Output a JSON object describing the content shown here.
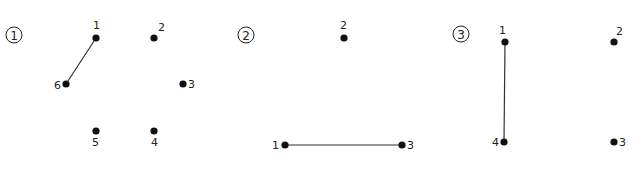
{
  "panels": [
    {
      "id": "1",
      "marker": "①",
      "points": [
        {
          "label": "1",
          "x": 96,
          "y": 38,
          "lx": 93,
          "ly": 29
        },
        {
          "label": "2",
          "x": 154,
          "y": 38,
          "lx": 158,
          "ly": 31
        },
        {
          "label": "3",
          "x": 183,
          "y": 84,
          "lx": 188,
          "ly": 88
        },
        {
          "label": "4",
          "x": 154,
          "y": 131,
          "lx": 151,
          "ly": 146
        },
        {
          "label": "5",
          "x": 96,
          "y": 131,
          "lx": 92,
          "ly": 146
        },
        {
          "label": "6",
          "x": 66,
          "y": 84,
          "lx": 54,
          "ly": 89
        }
      ],
      "segments": [
        [
          "1",
          "6"
        ]
      ]
    },
    {
      "id": "2",
      "marker": "②",
      "points": [
        {
          "label": "1",
          "x": 285,
          "y": 145,
          "lx": 272,
          "ly": 149
        },
        {
          "label": "2",
          "x": 344,
          "y": 38,
          "lx": 340,
          "ly": 29
        },
        {
          "label": "3",
          "x": 402,
          "y": 145,
          "lx": 407,
          "ly": 149
        }
      ],
      "segments": [
        [
          "1",
          "3"
        ]
      ]
    },
    {
      "id": "3",
      "marker": "③",
      "points": [
        {
          "label": "1",
          "x": 505,
          "y": 42,
          "lx": 499,
          "ly": 34
        },
        {
          "label": "2",
          "x": 614,
          "y": 42,
          "lx": 616,
          "ly": 35
        },
        {
          "label": "3",
          "x": 614,
          "y": 142,
          "lx": 619,
          "ly": 146
        },
        {
          "label": "4",
          "x": 504,
          "y": 142,
          "lx": 492,
          "ly": 146
        }
      ],
      "segments": [
        [
          "1",
          "4"
        ]
      ]
    }
  ],
  "markers": {
    "p1": "①",
    "p2": "②",
    "p3": "③"
  }
}
